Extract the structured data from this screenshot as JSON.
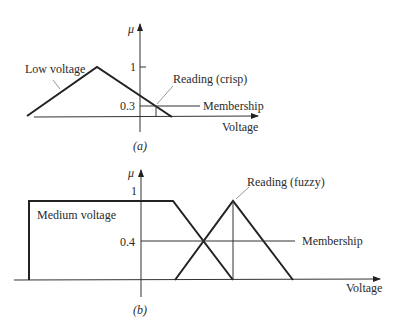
{
  "panel_a": {
    "caption": "(a)",
    "y_axis_label": "μ",
    "x_axis_label": "Voltage",
    "tick_1": "1",
    "tick_membership": "0.3",
    "set_label": "Low voltage",
    "reading_label": "Reading (crisp)",
    "membership_label": "Membership",
    "membership_value": 0.3
  },
  "panel_b": {
    "caption": "(b)",
    "y_axis_label": "μ",
    "x_axis_label": "Voltage",
    "tick_1": "1",
    "tick_membership": "0.4",
    "set_label": "Medium voltage",
    "reading_label": "Reading (fuzzy)",
    "membership_label": "Membership",
    "membership_value": 0.4
  },
  "colors": {
    "line": "#222222",
    "leader": "#999999"
  }
}
